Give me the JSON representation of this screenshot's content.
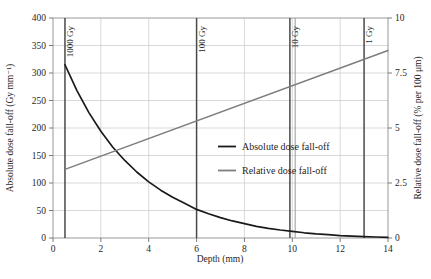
{
  "chart_data": {
    "type": "line",
    "title": "",
    "xlabel": "Depth (mm)",
    "ylabel": "Absolute dose fall-off (Gy mm⁻¹)",
    "y2label": "Relative dose fall-off (% per 100 μm)",
    "xlim": [
      0,
      14
    ],
    "ylim": [
      0,
      400
    ],
    "y2lim": [
      0,
      10
    ],
    "grid": true,
    "legend_position": "center-right",
    "x_ticks": [
      "0",
      "2",
      "4",
      "6",
      "8",
      "10",
      "12",
      "14"
    ],
    "x_tick_values": [
      0,
      2,
      4,
      6,
      8,
      10,
      12,
      14
    ],
    "y_ticks": [
      "0",
      "50",
      "100",
      "150",
      "200",
      "250",
      "300",
      "350",
      "400"
    ],
    "y_tick_values": [
      0,
      50,
      100,
      150,
      200,
      250,
      300,
      350,
      400
    ],
    "y2_ticks": [
      "0",
      "2.5",
      "5",
      "7.5",
      "10"
    ],
    "y2_tick_values": [
      0,
      2.5,
      5,
      7.5,
      10
    ],
    "series": [
      {
        "name": "Absolute dose fall-off",
        "axis": "left",
        "color": "#1a1a1a",
        "x": [
          0.5,
          1.0,
          1.5,
          2.0,
          2.5,
          3.0,
          3.5,
          4.0,
          4.5,
          5.0,
          5.5,
          6.0,
          6.5,
          7.0,
          7.5,
          8.0,
          8.5,
          9.0,
          9.5,
          10.0,
          10.5,
          11.0,
          11.5,
          12.0,
          12.5,
          13.0,
          13.5,
          14.0
        ],
        "values": [
          315,
          268,
          228,
          194,
          165,
          141,
          120,
          102,
          87,
          74,
          63,
          52,
          44,
          37,
          31,
          26,
          21,
          17.5,
          14.5,
          12,
          9.5,
          7.5,
          6,
          4.5,
          3.5,
          2.5,
          1.8,
          1.2
        ]
      },
      {
        "name": "Relative dose fall-off",
        "axis": "right",
        "color": "#7d7d7d",
        "x": [
          0.5,
          14
        ],
        "values": [
          3.12,
          8.52
        ]
      }
    ],
    "markers": [
      {
        "label": "1000 Gy",
        "x": 0.5
      },
      {
        "label": "100 Gy",
        "x": 6.0
      },
      {
        "label": "10 Gy",
        "x": 9.9,
        "x2": 10.12
      },
      {
        "label": "1 Gy",
        "x": 13.0
      }
    ]
  },
  "legend": {
    "items": [
      {
        "label": "Absolute dose fall-off"
      },
      {
        "label": "Relative dose fall-off"
      }
    ]
  },
  "caption": {
    "text": ""
  }
}
